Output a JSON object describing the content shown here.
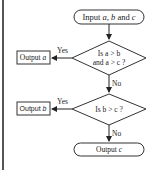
{
  "flowchart": {
    "start": {
      "prefix": "Input ",
      "a": "a",
      "sep1": ", ",
      "b": "b",
      "sep2": " and ",
      "c": "c"
    },
    "decision1": {
      "line1": "Is a > b",
      "line2": "and a > c ?",
      "yes": "Yes",
      "no": "No"
    },
    "output_a": {
      "prefix": "Output ",
      "var": "a"
    },
    "decision2": {
      "text": "Is b > c ?",
      "yes": "Yes",
      "no": "No"
    },
    "output_b": {
      "prefix": "Output ",
      "var": "b"
    },
    "end": {
      "prefix": "Output ",
      "var": "c"
    }
  }
}
